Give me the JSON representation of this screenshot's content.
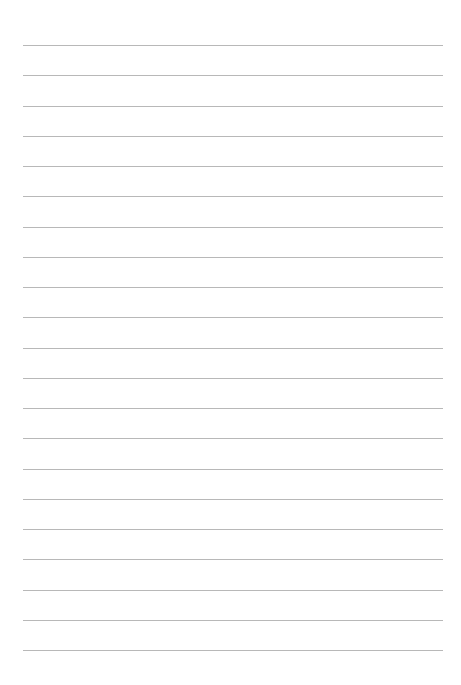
{
  "page": {
    "type": "lined-paper",
    "background": "#ffffff",
    "line_color": "#b8b8b8",
    "line_count": 21,
    "line_left_px": 23,
    "line_right_px": 443,
    "first_line_y_px": 45,
    "line_spacing_px": 30.25
  }
}
